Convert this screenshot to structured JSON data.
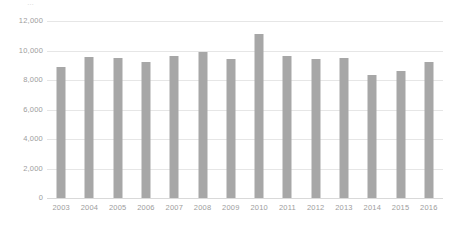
{
  "top_fragment": {
    "text": "…"
  },
  "chart_data": {
    "type": "bar",
    "title": "",
    "subtitle": "",
    "xlabel": "",
    "ylabel": "",
    "categories": [
      "2003",
      "2004",
      "2005",
      "2006",
      "2007",
      "2008",
      "2009",
      "2010",
      "2011",
      "2012",
      "2013",
      "2014",
      "2015",
      "2016"
    ],
    "values": [
      8850,
      9550,
      9480,
      9200,
      9630,
      9900,
      9450,
      11100,
      9620,
      9400,
      9480,
      8350,
      8630,
      9200
    ],
    "series": [
      {
        "name": "",
        "values": [
          8850,
          9550,
          9480,
          9200,
          9630,
          9900,
          9450,
          11100,
          9620,
          9400,
          9480,
          8350,
          8630,
          9200
        ]
      }
    ],
    "ylim": [
      0,
      12000
    ],
    "yticks": [
      0,
      2000,
      4000,
      6000,
      8000,
      10000,
      12000
    ],
    "ytick_labels": [
      "0",
      "2,000",
      "4,000",
      "6,000",
      "8,000",
      "10,000",
      "12,000"
    ],
    "grid": true,
    "grid_axis": "y",
    "legend": false,
    "legend_position": "none",
    "bar_color": "#a7a7a7",
    "grid_color": "#e6e6e6",
    "axis_text_color": "#9d9d9d",
    "background_color": "#ffffff",
    "annotations": []
  }
}
